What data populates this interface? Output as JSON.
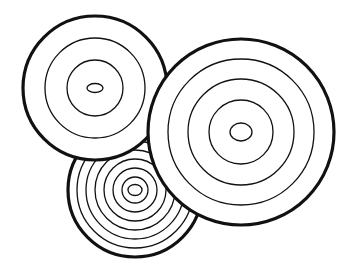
{
  "image": {
    "description": "Three overlapping concentric-ring circles (tree rings / targets) line drawing",
    "background": "#ffffff",
    "stroke": "#111111"
  },
  "circles": [
    {
      "name": "bottom-circle",
      "cx": 135,
      "cy": 190,
      "r": 67,
      "rings": [
        58,
        49,
        40,
        31,
        22,
        13
      ],
      "core": {
        "rx": 7,
        "ry": 5.5
      }
    },
    {
      "name": "top-left-circle",
      "cx": 95,
      "cy": 88,
      "r": 72,
      "rings": [
        50,
        28
      ],
      "core": {
        "rx": 8,
        "ry": 4.5
      }
    },
    {
      "name": "right-circle",
      "cx": 241,
      "cy": 132,
      "r": 93,
      "rings": [
        73,
        53,
        32
      ],
      "core": {
        "rx": 11,
        "ry": 9
      }
    }
  ]
}
